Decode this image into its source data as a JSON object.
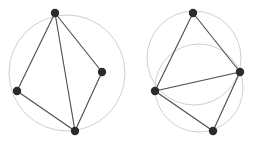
{
  "colors": {
    "background": "#ffffff",
    "circle": "#cfcfcf",
    "edge": "#4a4a4a",
    "vertex": "#2b2b2b"
  },
  "figures": [
    {
      "name": "left-figure",
      "circles": [
        {
          "cx": 67,
          "cy": 73,
          "r": 58
        }
      ],
      "vertices": [
        {
          "id": "top",
          "x": 55,
          "y": 13
        },
        {
          "id": "left",
          "x": 17,
          "y": 91
        },
        {
          "id": "right",
          "x": 102,
          "y": 72
        },
        {
          "id": "bottom",
          "x": 75,
          "y": 131
        }
      ],
      "edges": [
        [
          "top",
          "left"
        ],
        [
          "top",
          "right"
        ],
        [
          "top",
          "bottom"
        ],
        [
          "left",
          "bottom"
        ],
        [
          "right",
          "bottom"
        ]
      ]
    },
    {
      "name": "right-figure",
      "circles": [
        {
          "cx": 194,
          "cy": 58,
          "r": 47
        },
        {
          "cx": 199,
          "cy": 88,
          "r": 44
        }
      ],
      "vertices": [
        {
          "id": "top",
          "x": 193,
          "y": 13
        },
        {
          "id": "left",
          "x": 155,
          "y": 91
        },
        {
          "id": "right",
          "x": 240,
          "y": 72
        },
        {
          "id": "bottom",
          "x": 213,
          "y": 131
        }
      ],
      "edges": [
        [
          "top",
          "left"
        ],
        [
          "top",
          "right"
        ],
        [
          "left",
          "right"
        ],
        [
          "left",
          "bottom"
        ],
        [
          "right",
          "bottom"
        ]
      ]
    }
  ]
}
